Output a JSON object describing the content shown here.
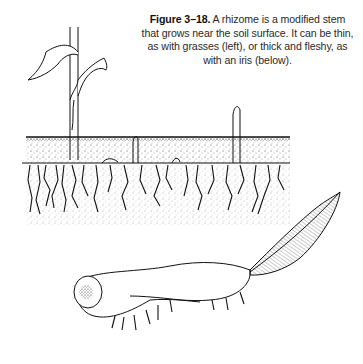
{
  "figure": {
    "label": "Figure 3–18.",
    "caption": " A rhizome is a modified stem that grows near the soil surface. It can be thin, as with grasses (left), or thick and fleshy, as with an iris (below)."
  },
  "illustration": {
    "top_panel": "grass-rhizome-in-soil-cross-section",
    "bottom_panel": "iris-rhizome",
    "line_color": "#1a1a1a",
    "background": "#ffffff"
  }
}
